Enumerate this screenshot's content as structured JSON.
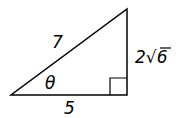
{
  "diagram": {
    "type": "right-triangle",
    "hypotenuse_label": "7",
    "base_label": "5",
    "height_label_coef": "2",
    "height_label_radical": "√",
    "height_label_radicand": "6",
    "angle_label": "θ",
    "stroke_color": "#000000"
  }
}
